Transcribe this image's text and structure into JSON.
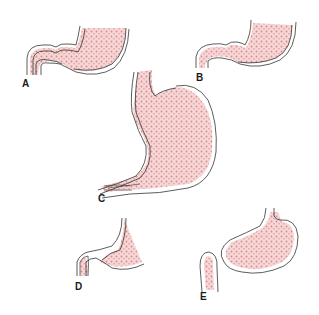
{
  "figure": {
    "colors": {
      "fill": "#f3c9c9",
      "dots": "#d98a8a",
      "outline": "#333333"
    },
    "panels": [
      {
        "id": "A",
        "label": "A"
      },
      {
        "id": "B",
        "label": "B"
      },
      {
        "id": "C",
        "label": "C"
      },
      {
        "id": "D",
        "label": "D"
      },
      {
        "id": "E",
        "label": "E"
      }
    ]
  }
}
